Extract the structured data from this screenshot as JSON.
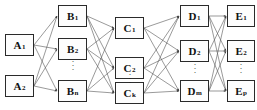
{
  "diagram": {
    "type": "layered-network-diagram",
    "title": "",
    "width": 257,
    "height": 110,
    "background_color": "#ffffff",
    "node_fill_color": "#fdfdfd",
    "node_border_color": "#2a2a2a",
    "edge_color": "#555555",
    "text_color": "#111111",
    "layers": [
      {
        "id": "A",
        "label_prefix": "A",
        "x": 5,
        "width": 29,
        "node_count_shown": 2,
        "has_ellipsis": false,
        "nodes": [
          {
            "name": "A1",
            "base": "A",
            "sub": "1",
            "x": 5,
            "y": 34,
            "w": 29,
            "h": 22
          },
          {
            "name": "A2",
            "base": "A",
            "sub": "2",
            "x": 5,
            "y": 75,
            "w": 29,
            "h": 22
          }
        ]
      },
      {
        "id": "B",
        "label_prefix": "B",
        "x": 58,
        "width": 29,
        "node_count_shown": 3,
        "has_ellipsis": true,
        "ellipsis": {
          "x": 66,
          "y": 59
        },
        "nodes": [
          {
            "name": "B1",
            "base": "B",
            "sub": "1",
            "x": 58,
            "y": 5,
            "w": 29,
            "h": 22
          },
          {
            "name": "B2",
            "base": "B",
            "sub": "2",
            "x": 58,
            "y": 38,
            "w": 29,
            "h": 22
          },
          {
            "name": "Bn",
            "base": "B",
            "sub": "n",
            "x": 58,
            "y": 80,
            "w": 29,
            "h": 22
          }
        ]
      },
      {
        "id": "C",
        "label_prefix": "C",
        "x": 115,
        "width": 29,
        "node_count_shown": 3,
        "has_ellipsis": true,
        "ellipsis": {
          "x": 123,
          "y": 72
        },
        "nodes": [
          {
            "name": "C1",
            "base": "C",
            "sub": "1",
            "x": 115,
            "y": 17,
            "w": 29,
            "h": 22
          },
          {
            "name": "C2",
            "base": "C",
            "sub": "2",
            "x": 115,
            "y": 57,
            "w": 29,
            "h": 22
          },
          {
            "name": "Ck",
            "base": "C",
            "sub": "k",
            "x": 115,
            "y": 82,
            "w": 29,
            "h": 22
          }
        ]
      },
      {
        "id": "D",
        "label_prefix": "D",
        "x": 180,
        "width": 29,
        "node_count_shown": 3,
        "has_ellipsis": true,
        "ellipsis": {
          "x": 188,
          "y": 62
        },
        "nodes": [
          {
            "name": "D1",
            "base": "D",
            "sub": "1",
            "x": 180,
            "y": 5,
            "w": 29,
            "h": 22
          },
          {
            "name": "D2",
            "base": "D",
            "sub": "2",
            "x": 180,
            "y": 40,
            "w": 29,
            "h": 22
          },
          {
            "name": "Dm",
            "base": "D",
            "sub": "m",
            "x": 180,
            "y": 80,
            "w": 29,
            "h": 22
          }
        ]
      },
      {
        "id": "E",
        "label_prefix": "E",
        "x": 227,
        "width": 28,
        "node_count_shown": 3,
        "has_ellipsis": true,
        "ellipsis": {
          "x": 234,
          "y": 62
        },
        "nodes": [
          {
            "name": "E1",
            "base": "E",
            "sub": "1",
            "x": 227,
            "y": 5,
            "w": 28,
            "h": 22
          },
          {
            "name": "E2",
            "base": "E",
            "sub": "2",
            "x": 227,
            "y": 40,
            "w": 28,
            "h": 22
          },
          {
            "name": "Ep",
            "base": "E",
            "sub": "p",
            "x": 227,
            "y": 80,
            "w": 28,
            "h": 22
          }
        ]
      }
    ],
    "connections": [
      {
        "from_layer": "A",
        "to_layer": "B",
        "pattern": "fully-connected"
      },
      {
        "from_layer": "B",
        "to_layer": "C",
        "pattern": "fully-connected"
      },
      {
        "from_layer": "C",
        "to_layer": "D",
        "pattern": "fully-connected"
      },
      {
        "from_layer": "D",
        "to_layer": "E",
        "pattern": "fully-connected"
      }
    ],
    "ellipsis_glyph": "⋮"
  }
}
